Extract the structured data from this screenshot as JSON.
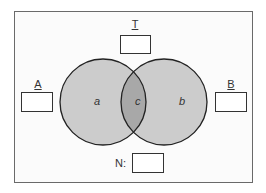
{
  "diagram": {
    "type": "venn",
    "sets": [
      {
        "id": "A",
        "label": "A",
        "region_label": "a"
      },
      {
        "id": "B",
        "label": "B",
        "region_label": "b"
      }
    ],
    "intersection": {
      "region_label": "c"
    },
    "universe": {
      "label": "T"
    },
    "total": {
      "label": "N:"
    },
    "colors": {
      "circle_fill": "#cccccc",
      "intersection_fill": "#a8a8a8",
      "stroke": "#222222",
      "frame": "#6a6a6a"
    }
  }
}
